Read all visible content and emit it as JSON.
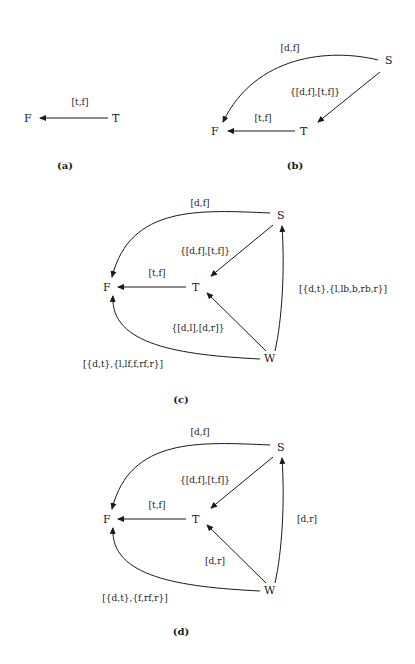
{
  "figures": [
    {
      "id": "a",
      "caption": "(a)",
      "nodes": {
        "F": "F",
        "T": "T"
      },
      "edges": [
        {
          "from": "T",
          "to": "F",
          "label": "[t,f]"
        }
      ]
    },
    {
      "id": "b",
      "caption": "(b)",
      "nodes": {
        "S": "S",
        "F": "F",
        "T": "T"
      },
      "edges": [
        {
          "from": "S",
          "to": "F",
          "label": "[d,f]"
        },
        {
          "from": "S",
          "to": "T",
          "label": "{[d,f],[t,f]}"
        },
        {
          "from": "T",
          "to": "F",
          "label": "[t,f]"
        }
      ]
    },
    {
      "id": "c",
      "caption": "(c)",
      "nodes": {
        "S": "S",
        "F": "F",
        "T": "T",
        "W": "W"
      },
      "edges": [
        {
          "from": "S",
          "to": "F",
          "label": "[d,f]"
        },
        {
          "from": "S",
          "to": "T",
          "label": "{[d,f],[t,f]}"
        },
        {
          "from": "T",
          "to": "F",
          "label": "[t,f]"
        },
        {
          "from": "W",
          "to": "T",
          "label": "{[d,l],[d,r]}"
        },
        {
          "from": "W",
          "to": "S",
          "label": "[{d,t},{l,lb,b,rb,r}]"
        },
        {
          "from": "W",
          "to": "F",
          "label": "[{d,t},{l,lf,f,rf,r}]"
        }
      ]
    },
    {
      "id": "d",
      "caption": "(d)",
      "nodes": {
        "S": "S",
        "F": "F",
        "T": "T",
        "W": "W"
      },
      "edges": [
        {
          "from": "S",
          "to": "F",
          "label": "[d,f]"
        },
        {
          "from": "S",
          "to": "T",
          "label": "{[d,f],[t,f]}"
        },
        {
          "from": "T",
          "to": "F",
          "label": "[t,f]"
        },
        {
          "from": "W",
          "to": "T",
          "label": "[d,r]"
        },
        {
          "from": "W",
          "to": "S",
          "label": "[d,r]"
        },
        {
          "from": "W",
          "to": "F",
          "label": "[{d,t},{f,rf,r}]"
        }
      ]
    }
  ]
}
